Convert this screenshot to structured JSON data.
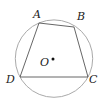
{
  "diagram": {
    "type": "geometry",
    "circle": {
      "cx": 54,
      "cy": 58.6,
      "r": 38.7,
      "stroke": "#aaaaaa"
    },
    "points": {
      "A": {
        "x": 39,
        "y": 23,
        "label": "A",
        "lx": 33,
        "ly": 18
      },
      "B": {
        "x": 74,
        "y": 27,
        "label": "B",
        "lx": 77,
        "ly": 20
      },
      "C": {
        "x": 88,
        "y": 77,
        "label": "C",
        "lx": 89,
        "ly": 83
      },
      "D": {
        "x": 20,
        "y": 77,
        "label": "D",
        "lx": 6,
        "ly": 83
      },
      "O": {
        "x": 53,
        "y": 59,
        "label": "O",
        "lx": 40,
        "ly": 66
      }
    },
    "edges": [
      "AB",
      "BC",
      "CD",
      "DA"
    ],
    "line_color": "#555555"
  }
}
